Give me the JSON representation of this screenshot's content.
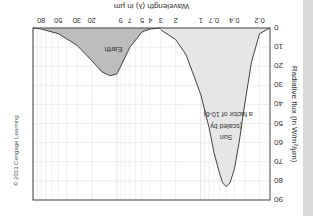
{
  "chart_data": {
    "type": "area",
    "title": "",
    "xlabel": "Wavelength (λ) in µm",
    "ylabel": "Radiative flux (in W/m²/µm)",
    "x_scale": "log",
    "xlim": [
      0.15,
      100
    ],
    "ylim": [
      0,
      90
    ],
    "x_ticks": [
      "0.2",
      "0.4",
      "0.7",
      "1",
      "2",
      "3",
      "4",
      "5",
      "7",
      "9",
      "20",
      "30",
      "50",
      "80"
    ],
    "y_ticks": [
      "0",
      "10",
      "20",
      "30",
      "40",
      "50",
      "60",
      "70",
      "80",
      "90"
    ],
    "grid": true,
    "series": [
      {
        "name": "Sun (scaled by a factor of 10-6)",
        "color": "#e6e6e6",
        "x": [
          0.15,
          0.2,
          0.25,
          0.3,
          0.35,
          0.4,
          0.45,
          0.5,
          0.55,
          0.6,
          0.7,
          0.8,
          1.0,
          1.5,
          2,
          3
        ],
        "y": [
          0,
          3,
          18,
          40,
          60,
          74,
          81,
          83,
          81,
          76,
          65,
          52,
          35,
          14,
          6,
          1
        ]
      },
      {
        "name": "Earth",
        "color": "#bdbdbd",
        "x": [
          3,
          4,
          5,
          7,
          9,
          10,
          12,
          15,
          20,
          30,
          50,
          80,
          100
        ],
        "y": [
          0,
          0.5,
          2,
          10,
          20,
          24,
          25,
          23,
          17,
          9,
          3,
          0.5,
          0
        ]
      }
    ],
    "annotations": [
      {
        "text": "Sun",
        "subtext": "(scaled by a factor of 10-6)"
      },
      {
        "text": "Earth"
      }
    ],
    "rotation_deg": 180
  },
  "labels": {
    "xlabel": "Wavelength (λ) in µm",
    "ylabel": "Radiative flux (in W/m²/µm)",
    "sun_line1": "Sun",
    "sun_line2": "(scaled by",
    "sun_line3": "a factor of 10-6)",
    "earth": "Earth",
    "copyright": "© 2013 Cengage Learning"
  }
}
